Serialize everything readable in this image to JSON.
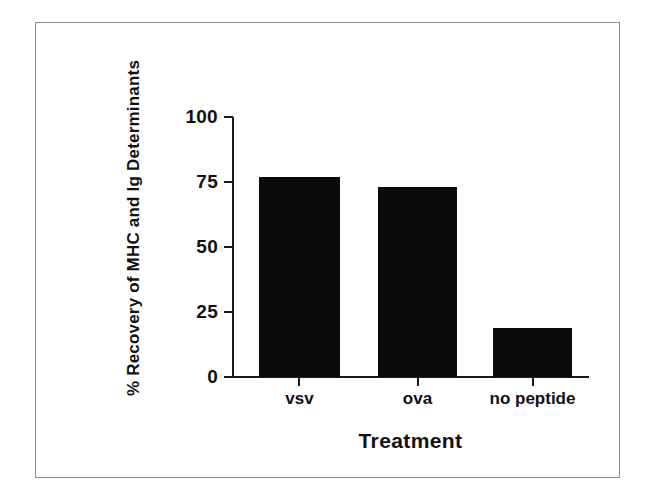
{
  "chart_data": {
    "type": "bar",
    "title": "",
    "subtitle": "",
    "xlabel": "Treatment",
    "ylabel": "% Recovery of MHC and Ig Determinants",
    "categories": [
      "vsv",
      "ova",
      "no peptide"
    ],
    "values": [
      77,
      73,
      19
    ],
    "ylim": [
      0,
      100
    ],
    "yticks": [
      0,
      25,
      50,
      75,
      100
    ],
    "ytick_labels": [
      "0",
      "25",
      "50",
      "75",
      "100"
    ],
    "grid": false,
    "legend": null,
    "legend_position": "none",
    "bar_color": "#0a0a0a",
    "axis_color": "#1a1a1a",
    "background_color": "#ffffff",
    "frame_color": "#8d8d8d",
    "annotations": []
  }
}
